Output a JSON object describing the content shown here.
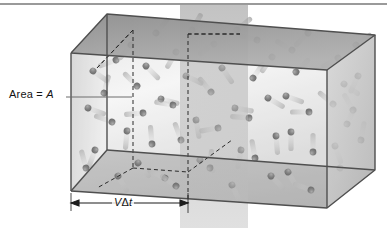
{
  "figure": {
    "kind": "kinetic-theory-gas-box-diagram",
    "labels": {
      "area_prefix": "Area = ",
      "area_symbol": "A",
      "distance_velocity": "V",
      "distance_delta": "Δ",
      "distance_time": "t"
    },
    "icon_names": [
      "gas-molecule-sphere",
      "motion-blur-streak",
      "dimension-arrow"
    ],
    "colors": {
      "background": "#ffffff",
      "top_rule": "#9a9a9a",
      "box_top_face": "#9d9d9d",
      "box_left_face": "#c9c9c9",
      "box_bottom_face": "#b4b4b4",
      "box_right_face": "#c4c4c4",
      "box_edge": "#555555",
      "dashed_line": "#2b2b2b",
      "plane_fill": "#a8a8a8",
      "molecule": "#5e5e5e",
      "molecule_highlight": "#8e8e8e",
      "trail": "#b9b9b9",
      "label_text": "#131313",
      "leader_line": "#6d6d6d",
      "arrow": "#1d1d1d"
    },
    "geometry": {
      "front_bottom_left": [
        71,
        191
      ],
      "front_top_left": [
        71,
        53
      ],
      "front_bottom_right": [
        327,
        208
      ],
      "front_top_right": [
        327,
        70
      ],
      "back_top_left": [
        107,
        14
      ],
      "back_top_right": [
        375,
        35
      ],
      "back_bottom_right": [
        375,
        170
      ],
      "slab_front_x": 188,
      "plane_x_left": 180,
      "plane_x_right": 248,
      "plane_top_y": 5,
      "dimension_arrow": {
        "x1": 71,
        "x2": 188,
        "y": 203
      }
    },
    "molecules": [
      {
        "x": 93,
        "y": 71,
        "a": 35
      },
      {
        "x": 116,
        "y": 60,
        "a": 160
      },
      {
        "x": 104,
        "y": 93,
        "a": 285
      },
      {
        "x": 88,
        "y": 108,
        "a": 20
      },
      {
        "x": 112,
        "y": 122,
        "a": 200
      },
      {
        "x": 95,
        "y": 150,
        "a": 110
      },
      {
        "x": 86,
        "y": 168,
        "a": 255
      },
      {
        "x": 118,
        "y": 176,
        "a": 60
      },
      {
        "x": 131,
        "y": 45,
        "a": 130
      },
      {
        "x": 156,
        "y": 33,
        "a": 310
      },
      {
        "x": 146,
        "y": 66,
        "a": 45
      },
      {
        "x": 137,
        "y": 86,
        "a": 225
      },
      {
        "x": 161,
        "y": 99,
        "a": 15
      },
      {
        "x": 143,
        "y": 113,
        "a": 175
      },
      {
        "x": 127,
        "y": 131,
        "a": 95
      },
      {
        "x": 152,
        "y": 144,
        "a": 265
      },
      {
        "x": 138,
        "y": 163,
        "a": 50
      },
      {
        "x": 165,
        "y": 178,
        "a": 205
      },
      {
        "x": 176,
        "y": 52,
        "a": 120
      },
      {
        "x": 192,
        "y": 30,
        "a": 300
      },
      {
        "x": 186,
        "y": 76,
        "a": 25
      },
      {
        "x": 173,
        "y": 105,
        "a": 190
      },
      {
        "x": 196,
        "y": 120,
        "a": 80
      },
      {
        "x": 181,
        "y": 140,
        "a": 250
      },
      {
        "x": 200,
        "y": 160,
        "a": 40
      },
      {
        "x": 176,
        "y": 186,
        "a": 215
      },
      {
        "x": 214,
        "y": 44,
        "a": 145
      },
      {
        "x": 237,
        "y": 30,
        "a": 320
      },
      {
        "x": 222,
        "y": 68,
        "a": 55
      },
      {
        "x": 211,
        "y": 92,
        "a": 230
      },
      {
        "x": 235,
        "y": 108,
        "a": 10
      },
      {
        "x": 218,
        "y": 128,
        "a": 170
      },
      {
        "x": 241,
        "y": 150,
        "a": 100
      },
      {
        "x": 210,
        "y": 168,
        "a": 275
      },
      {
        "x": 232,
        "y": 185,
        "a": 65
      },
      {
        "x": 257,
        "y": 40,
        "a": 195
      },
      {
        "x": 272,
        "y": 57,
        "a": 125
      },
      {
        "x": 253,
        "y": 78,
        "a": 305
      },
      {
        "x": 268,
        "y": 98,
        "a": 30
      },
      {
        "x": 249,
        "y": 118,
        "a": 185
      },
      {
        "x": 276,
        "y": 136,
        "a": 85
      },
      {
        "x": 255,
        "y": 158,
        "a": 260
      },
      {
        "x": 271,
        "y": 176,
        "a": 45
      },
      {
        "x": 292,
        "y": 50,
        "a": 210
      },
      {
        "x": 308,
        "y": 33,
        "a": 135
      },
      {
        "x": 296,
        "y": 72,
        "a": 315
      },
      {
        "x": 286,
        "y": 96,
        "a": 20
      },
      {
        "x": 309,
        "y": 112,
        "a": 180
      },
      {
        "x": 291,
        "y": 132,
        "a": 90
      },
      {
        "x": 313,
        "y": 152,
        "a": 270
      },
      {
        "x": 288,
        "y": 172,
        "a": 60
      },
      {
        "x": 311,
        "y": 190,
        "a": 200
      },
      {
        "x": 338,
        "y": 58,
        "a": 150
      },
      {
        "x": 356,
        "y": 45,
        "a": 325
      },
      {
        "x": 344,
        "y": 84,
        "a": 35
      },
      {
        "x": 333,
        "y": 104,
        "a": 220
      },
      {
        "x": 358,
        "y": 76,
        "a": 115
      },
      {
        "x": 347,
        "y": 124,
        "a": 295
      },
      {
        "x": 335,
        "y": 146,
        "a": 70
      },
      {
        "x": 353,
        "y": 110,
        "a": 240
      },
      {
        "x": 340,
        "y": 168,
        "a": 105
      },
      {
        "x": 361,
        "y": 140,
        "a": 280
      }
    ]
  }
}
